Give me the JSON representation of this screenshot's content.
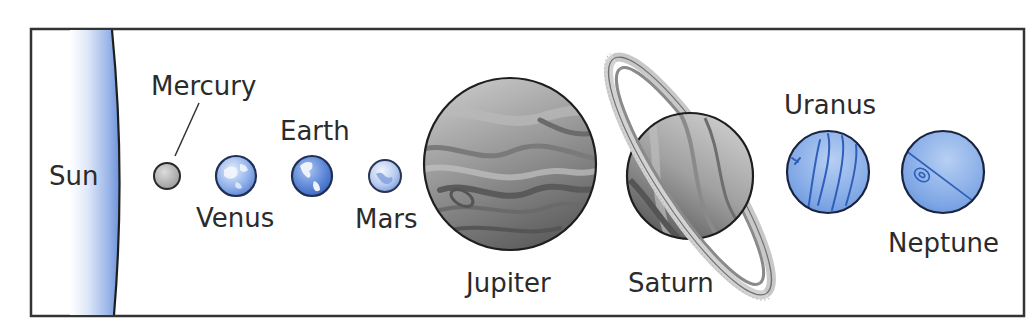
{
  "diagram": {
    "type": "solar-system-lineup",
    "frame": {
      "border_color": "#333333",
      "background": "#ffffff"
    },
    "colors": {
      "sun_blue": "#6e92da",
      "rocky_gray": "#b8b8b8",
      "earthlike_blue": "#5b86d6",
      "gas_gray": "#8c8c8c",
      "ice_blue": "#7aa3e3",
      "outline": "#222222",
      "text": "#2b2b2b"
    },
    "bodies": [
      {
        "name": "Sun",
        "label": "Sun",
        "kind": "star"
      },
      {
        "name": "Mercury",
        "label": "Mercury",
        "kind": "rocky"
      },
      {
        "name": "Venus",
        "label": "Venus",
        "kind": "rocky"
      },
      {
        "name": "Earth",
        "label": "Earth",
        "kind": "rocky"
      },
      {
        "name": "Mars",
        "label": "Mars",
        "kind": "rocky"
      },
      {
        "name": "Jupiter",
        "label": "Jupiter",
        "kind": "gas-giant"
      },
      {
        "name": "Saturn",
        "label": "Saturn",
        "kind": "gas-giant-ringed"
      },
      {
        "name": "Uranus",
        "label": "Uranus",
        "kind": "ice-giant"
      },
      {
        "name": "Neptune",
        "label": "Neptune",
        "kind": "ice-giant"
      }
    ]
  }
}
